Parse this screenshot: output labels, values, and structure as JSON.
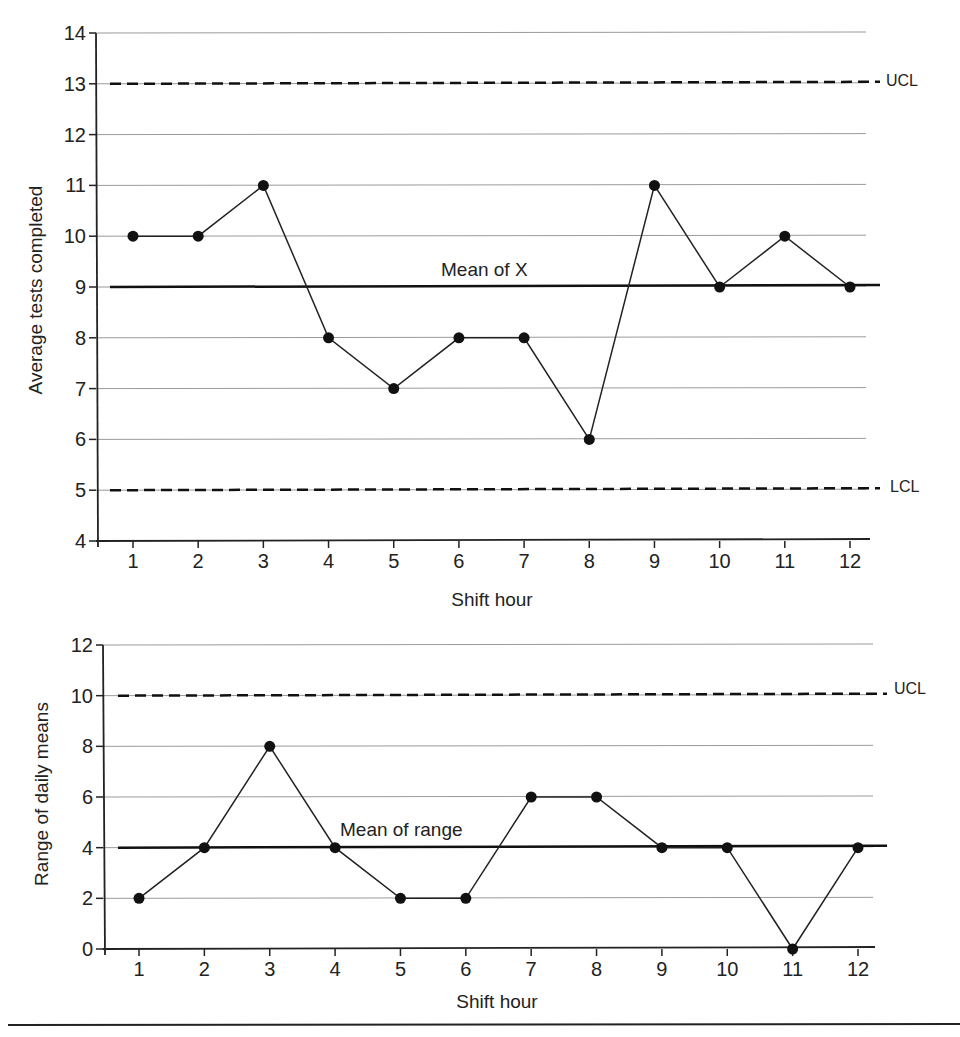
{
  "chart_data": [
    {
      "type": "line",
      "title": "X-bar control chart",
      "xlabel": "Shift hour",
      "ylabel": "Average tests completed",
      "x": [
        1,
        2,
        3,
        4,
        5,
        6,
        7,
        8,
        9,
        10,
        11,
        12
      ],
      "series": [
        {
          "name": "Average tests completed",
          "values": [
            10,
            10,
            11,
            8,
            7,
            8,
            8,
            6,
            11,
            9,
            10,
            9
          ]
        }
      ],
      "reference_lines": [
        {
          "name": "UCL",
          "value": 13,
          "style": "dashed"
        },
        {
          "name": "Mean of X",
          "value": 9,
          "style": "solid"
        },
        {
          "name": "LCL",
          "value": 5,
          "style": "dashed"
        }
      ],
      "ylim": [
        4,
        14
      ],
      "yticks": [
        4,
        5,
        6,
        7,
        8,
        9,
        10,
        11,
        12,
        13,
        14
      ],
      "grid": true
    },
    {
      "type": "line",
      "title": "Range control chart",
      "xlabel": "Shift hour",
      "ylabel": "Range of daily means",
      "x": [
        1,
        2,
        3,
        4,
        5,
        6,
        7,
        8,
        9,
        10,
        11,
        12
      ],
      "series": [
        {
          "name": "Range of daily means",
          "values": [
            2,
            4,
            8,
            4,
            2,
            2,
            6,
            6,
            4,
            4,
            0,
            4
          ]
        }
      ],
      "reference_lines": [
        {
          "name": "UCL",
          "value": 10,
          "style": "dashed"
        },
        {
          "name": "Mean of range",
          "value": 4,
          "style": "solid"
        }
      ],
      "ylim": [
        0,
        12
      ],
      "yticks": [
        0,
        2,
        4,
        6,
        8,
        10,
        12
      ],
      "grid": true
    }
  ],
  "labels": {
    "top": {
      "xlabel": "Shift hour",
      "ylabel": "Average tests completed",
      "ucl": "UCL",
      "lcl": "LCL",
      "mean": "Mean of X"
    },
    "bottom": {
      "xlabel": "Shift hour",
      "ylabel": "Range of daily means",
      "ucl": "UCL",
      "mean": "Mean of range"
    }
  }
}
